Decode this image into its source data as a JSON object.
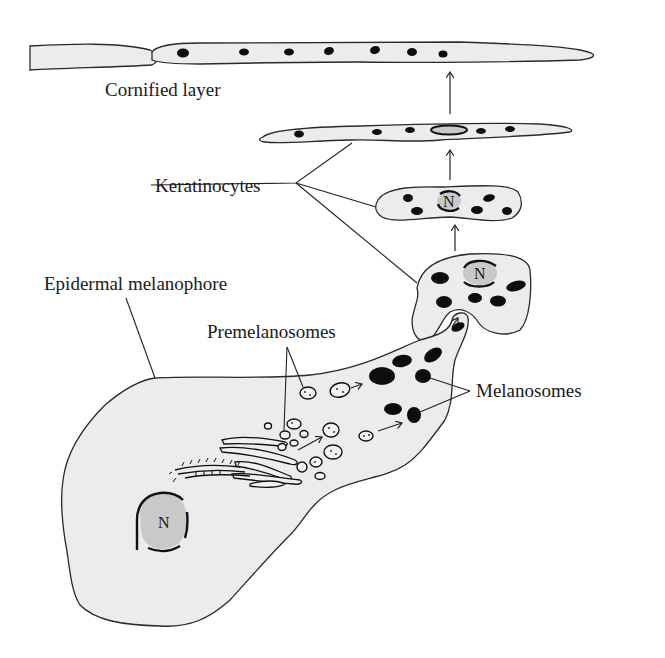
{
  "diagram": {
    "labels": {
      "cornified_layer": "Cornified layer",
      "keratinocytes": "Keratinocytes",
      "epidermal_melanophore": "Epidermal melanophore",
      "premelanosomes": "Premelanosomes",
      "melanosomes": "Melanosomes"
    },
    "nucleus_labels": {
      "keratinocyte_mid": "N",
      "keratinocyte_low": "N",
      "melanophore": "N"
    },
    "colors": {
      "cytoplasm": "#ececec",
      "nucleus": "#c9c9c9",
      "granule": "#0d0d0d",
      "outline": "#2a2a2a"
    },
    "flow": [
      "Premelanosomes",
      "Melanosomes",
      "Keratinocytes",
      "Cornified layer"
    ]
  }
}
